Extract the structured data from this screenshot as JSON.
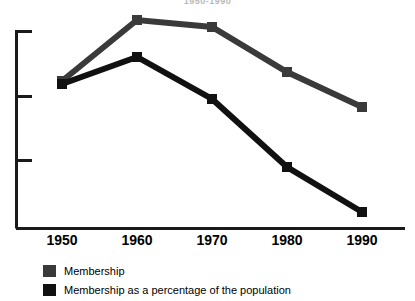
{
  "chart_data": {
    "type": "line",
    "title": "1950-1990",
    "xlabel": "",
    "ylabel": "",
    "categories": [
      "1950",
      "1960",
      "1970",
      "1980",
      "1990"
    ],
    "x": [
      1950,
      1960,
      1970,
      1980,
      1990
    ],
    "grid": false,
    "legend_position": "below",
    "y_axis": {
      "ticks_visible": 3,
      "tick_labels": [
        "",
        "",
        ""
      ],
      "tick_values_unlabeled": true,
      "range_note": "unlabeled axis"
    },
    "series": [
      {
        "name": "Membership",
        "color": "#3a3a3a",
        "marker": "square",
        "values": [
          74,
          105,
          102,
          78,
          62
        ],
        "pixel_y": [
          81,
          20,
          27,
          72,
          107
        ]
      },
      {
        "name": "Membership as a percentage of the population",
        "color": "#111111",
        "marker": "square",
        "values": [
          73,
          92,
          71,
          37,
          15
        ],
        "pixel_y": [
          84,
          57,
          99,
          167,
          212
        ]
      }
    ]
  },
  "axis": {
    "x_labels": [
      "1950",
      "1960",
      "1970",
      "1980",
      "1990"
    ],
    "x_pixel_positions": [
      62,
      137,
      212,
      287,
      362
    ],
    "y_tick_pixel_positions": [
      31,
      96,
      160
    ],
    "axis_color": "#1a1a1a"
  },
  "legend": {
    "items": [
      {
        "label": "Membership",
        "color": "#3a3a3a"
      },
      {
        "label": "Membership as a percentage of the population",
        "color": "#111111"
      }
    ]
  }
}
